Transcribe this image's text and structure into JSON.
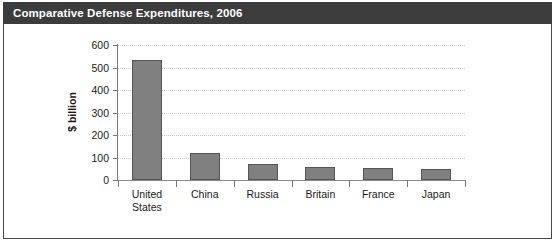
{
  "header": {
    "title": "Comparative Defense Expenditures, 2006"
  },
  "chart_data": {
    "type": "bar",
    "title": "Comparative Defense Expenditures, 2006",
    "xlabel": "",
    "ylabel": "$ billion",
    "categories": [
      "United States",
      "China",
      "Russia",
      "Britain",
      "France",
      "Japan"
    ],
    "category_label_lines": [
      [
        "United",
        "States"
      ],
      [
        "China"
      ],
      [
        "Russia"
      ],
      [
        "Britain"
      ],
      [
        "France"
      ],
      [
        "Japan"
      ]
    ],
    "values": [
      535,
      122,
      70,
      60,
      55,
      47
    ],
    "ylim": [
      0,
      600
    ],
    "yticks": [
      0,
      100,
      200,
      300,
      400,
      500,
      600
    ],
    "ytick_labels": [
      "0",
      "100",
      "200",
      "300",
      "400",
      "500",
      "600"
    ],
    "grid": true,
    "legend": false,
    "bar_color": "#808080",
    "bar_edge_color": "#555555",
    "gridline_color": "#c8c8c8",
    "axis_color": "#7a7a7a",
    "title_bar_color": "#3c3c3c",
    "title_text_color": "#ffffff",
    "background_color": "#ffffff"
  }
}
